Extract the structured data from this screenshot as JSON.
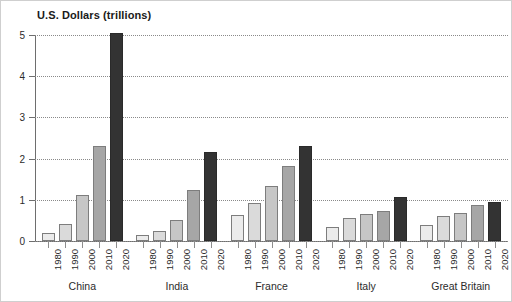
{
  "chart_data": {
    "type": "bar",
    "title": "U.S. Dollars (trillions)",
    "xlabel": "",
    "ylabel": "U.S. Dollars (trillions)",
    "ylim": [
      0,
      5
    ],
    "yticks": [
      0,
      1,
      2,
      3,
      4,
      5
    ],
    "ytick_labels": [
      "0",
      "1",
      "2",
      "3",
      "4",
      "5"
    ],
    "grid": "horizontal-dotted",
    "legend": "none",
    "categories": [
      "1980",
      "1990",
      "2000",
      "2010",
      "2020"
    ],
    "groups": [
      "China",
      "India",
      "France",
      "Italy",
      "Great Britain"
    ],
    "series": [
      {
        "name": "China",
        "categories": [
          "1980",
          "1990",
          "2000",
          "2010",
          "2020"
        ],
        "values": [
          0.2,
          0.42,
          1.12,
          2.3,
          5.05
        ]
      },
      {
        "name": "India",
        "categories": [
          "1980",
          "1990",
          "2000",
          "2010",
          "2020"
        ],
        "values": [
          0.14,
          0.25,
          0.52,
          1.25,
          2.16
        ]
      },
      {
        "name": "France",
        "categories": [
          "1980",
          "1990",
          "2000",
          "2010",
          "2020"
        ],
        "values": [
          0.63,
          0.92,
          1.33,
          1.83,
          2.3
        ]
      },
      {
        "name": "Italy",
        "categories": [
          "1980",
          "1990",
          "2000",
          "2010",
          "2020"
        ],
        "values": [
          0.35,
          0.55,
          0.65,
          0.72,
          1.08
        ]
      },
      {
        "name": "Great Britain",
        "categories": [
          "1980",
          "1990",
          "2000",
          "2010",
          "2020"
        ],
        "values": [
          0.4,
          0.6,
          0.67,
          0.88,
          0.95
        ]
      }
    ],
    "bar_colors": [
      "#ebebeb",
      "#dadada",
      "#c6c6c6",
      "#a6a6a6",
      "#333333"
    ],
    "colors": {
      "background": "#ffffff",
      "axis": "#6e6e6e",
      "gridline": "#8a8a8a",
      "text": "#2b2b2b",
      "title": "#1a1a1a",
      "bar_outline": "#7d7d7d"
    }
  }
}
